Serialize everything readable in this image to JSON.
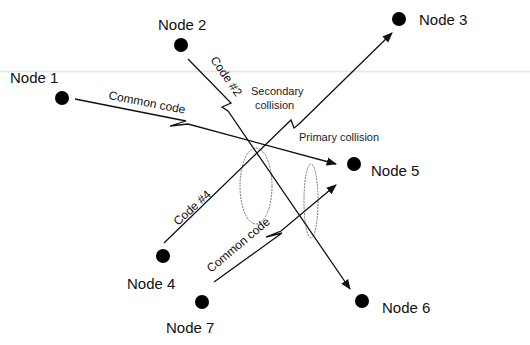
{
  "nodes": [
    {
      "id": "node-1",
      "label": "Node 1",
      "x": 62,
      "y": 98,
      "lx": 10,
      "ly": 77
    },
    {
      "id": "node-2",
      "label": "Node 2",
      "x": 181,
      "y": 45,
      "lx": 158,
      "ly": 25
    },
    {
      "id": "node-3",
      "label": "Node 3",
      "x": 399,
      "y": 19,
      "lx": 419,
      "ly": 25
    },
    {
      "id": "node-4",
      "label": "Node 4",
      "x": 163,
      "y": 256,
      "lx": 127,
      "ly": 288
    },
    {
      "id": "node-5",
      "label": "Node 5",
      "x": 354,
      "y": 164,
      "lx": 371,
      "ly": 176
    },
    {
      "id": "node-6",
      "label": "Node 6",
      "x": 362,
      "y": 301,
      "lx": 382,
      "ly": 313
    },
    {
      "id": "node-7",
      "label": "Node 7",
      "x": 202,
      "y": 302,
      "lx": 166,
      "ly": 332
    }
  ],
  "edges": [
    {
      "id": "edge-node1-node5",
      "from": "Node 1",
      "to": "Node 5",
      "label": "Common code"
    },
    {
      "id": "edge-node2-node6",
      "from": "Node 2",
      "to": "Node 6",
      "label": "Code #2"
    },
    {
      "id": "edge-node4-node3",
      "from": "Node 4",
      "to": "Node 3",
      "label": "Code #4"
    },
    {
      "id": "edge-node7-node5",
      "from": "Node 7",
      "to": "Node 5",
      "label": "Common code"
    }
  ],
  "annotations": {
    "secondary_collision": [
      "Secondary",
      "collision"
    ],
    "primary_collision": "Primary collision"
  },
  "colors": {
    "node": "#000000",
    "edge": "#111111",
    "ellipse": "#777777"
  }
}
